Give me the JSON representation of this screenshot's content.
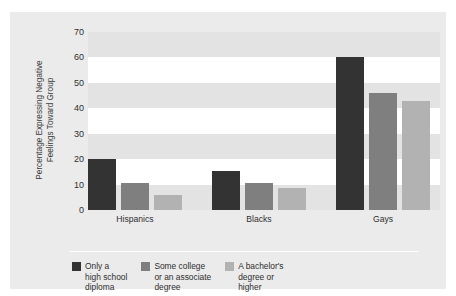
{
  "figure": {
    "clipped_title_text": "",
    "background_color": "#ffffff",
    "panel_color": "#ebebeb",
    "band_color": "#e3e3e3",
    "plot_background_color": "#ffffff"
  },
  "chart_data": {
    "type": "bar",
    "title": "",
    "xlabel": "",
    "ylabel": "Percentage Expressing Negative\nFeelings Toward Group",
    "ylabel_line1": "Percentage Expressing Negative",
    "ylabel_line2": "Feelings Toward Group",
    "categories": [
      "Hispanics",
      "Blacks",
      "Gays"
    ],
    "ylim": [
      0,
      70
    ],
    "yticks": [
      0,
      10,
      20,
      30,
      40,
      50,
      60,
      70
    ],
    "ytick_labels": [
      "0",
      "10",
      "20",
      "30",
      "40",
      "50",
      "60",
      "70"
    ],
    "grid": "horizontal-bands",
    "legend_position": "bottom-left",
    "series": [
      {
        "name": "Only a\nhigh school\ndiploma",
        "color": "#333333",
        "values": [
          20,
          15.5,
          60
        ]
      },
      {
        "name": "Some college\nor an associate\ndegree",
        "color": "#7f7f7f",
        "values": [
          10.5,
          10.5,
          46
        ]
      },
      {
        "name": "A bachelor's\ndegree or\nhigher",
        "color": "#b2b2b2",
        "values": [
          6,
          8.5,
          43
        ]
      }
    ]
  }
}
